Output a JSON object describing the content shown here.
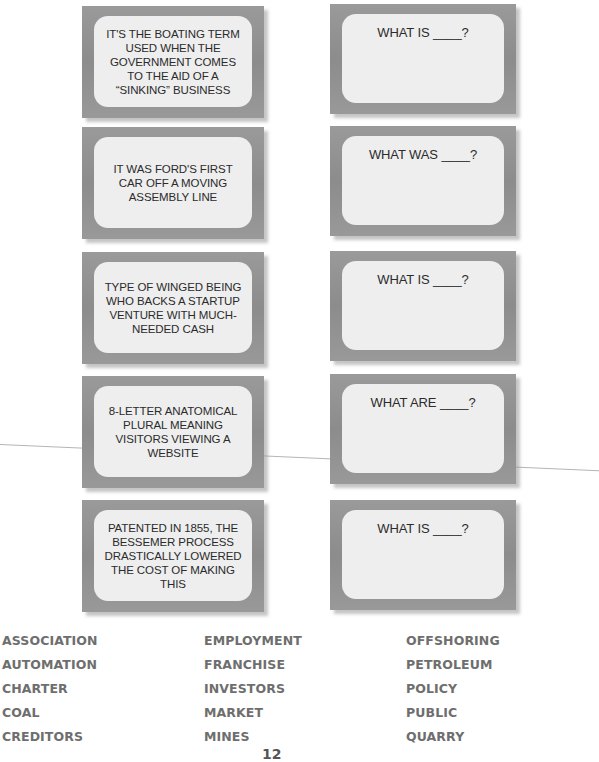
{
  "clue_cards": [
    {
      "text": "IT'S THE BOATING TERM USED WHEN THE GOVERNMENT COMES TO THE AID OF A “SINKING” BUSINESS"
    },
    {
      "text": "IT WAS FORD'S FIRST CAR OFF A MOVING ASSEMBLY LINE"
    },
    {
      "text": "TYPE OF WINGED BEING WHO BACKS A STARTUP VENTURE WITH MUCH-NEEDED CASH"
    },
    {
      "text": "8-LETTER ANATOMICAL PLURAL MEANING VISITORS VIEWING A WEBSITE"
    },
    {
      "text": "PATENTED IN 1855, THE BESSEMER PROCESS DRASTICALLY LOWERED THE COST OF MAKING THIS"
    }
  ],
  "answer_cards": [
    {
      "text": "WHAT IS ____?"
    },
    {
      "text": "WHAT WAS ____?"
    },
    {
      "text": "WHAT IS ____?"
    },
    {
      "text": "WHAT ARE ____?"
    },
    {
      "text": "WHAT IS ____?"
    }
  ],
  "word_bank": {
    "columns": [
      [
        "ASSOCIATION",
        "AUTOMATION",
        "CHARTER",
        "COAL",
        "CREDITORS"
      ],
      [
        "EMPLOYMENT",
        "FRANCHISE",
        "INVESTORS",
        "MARKET",
        "MINES"
      ],
      [
        "OFFSHORING",
        "PETROLEUM",
        "POLICY",
        "PUBLIC",
        "QUARRY"
      ]
    ]
  },
  "page_number": "12"
}
